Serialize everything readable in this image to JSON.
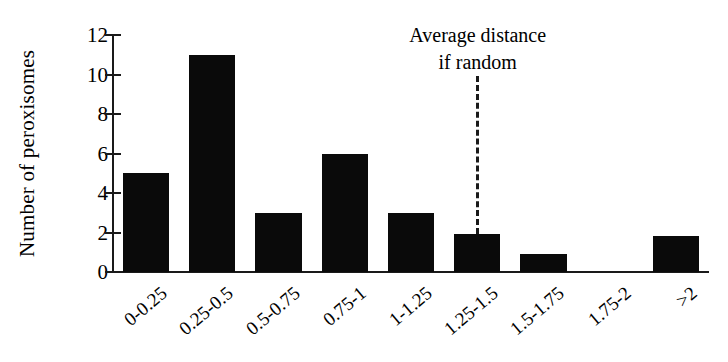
{
  "chart_data": {
    "type": "bar",
    "title": "",
    "xlabel": "",
    "ylabel": "Number of peroxisomes",
    "categories": [
      "0-0.25",
      "0.25-0.5",
      "0.5-0.75",
      "0.75-1",
      "1-1.25",
      "1.25-1.5",
      "1.5-1.75",
      "1.75-2",
      ">2"
    ],
    "values": [
      5,
      11,
      3,
      6,
      3,
      1.9,
      0.9,
      0,
      1.8
    ],
    "ylim": [
      0,
      12
    ],
    "yticks": [
      0,
      2,
      4,
      6,
      8,
      10,
      12
    ],
    "ytick_labels": [
      "0",
      "2",
      "4",
      "6",
      "8",
      "10",
      "12"
    ],
    "grid": false,
    "legend": "none",
    "annotations": [
      {
        "text_line1": "Average distance",
        "text_line2": "if random",
        "style": "dashed-vertical-line",
        "at_category": "1.25-1.5"
      }
    ],
    "colors": {
      "bar": "#0a0a0a",
      "axis": "#1a1a1a",
      "background": "#ffffff",
      "text": "#000000"
    }
  }
}
